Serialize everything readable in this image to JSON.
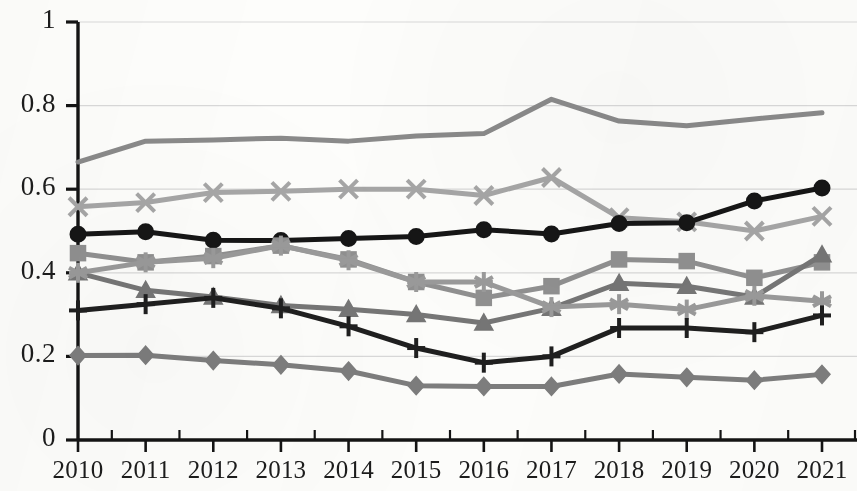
{
  "chart_data": {
    "type": "line",
    "title": "",
    "subtitle": "",
    "xlabel": "",
    "ylabel": "",
    "grid": "horizontal",
    "legend": "none",
    "xlim": [
      2010,
      2021
    ],
    "ylim": [
      0,
      1
    ],
    "ytick_labels": [
      "1",
      "0.8",
      "0.6",
      "0.4",
      "0.2",
      "0"
    ],
    "ytick_values": [
      1,
      0.8,
      0.6,
      0.4,
      0.2,
      0
    ],
    "categories": [
      "2010",
      "2011",
      "2012",
      "2013",
      "2014",
      "2015",
      "2016",
      "2017",
      "2018",
      "2019",
      "2020",
      "2021"
    ],
    "x": [
      2010,
      2011,
      2012,
      2013,
      2014,
      2015,
      2016,
      2017,
      2018,
      2019,
      2020,
      2021
    ],
    "series": [
      {
        "name": "series-1-plain-line",
        "marker": "none",
        "color": "#8a8a8a",
        "width": 5,
        "values": [
          0.665,
          0.715,
          0.718,
          0.722,
          0.715,
          0.727,
          0.733,
          0.815,
          0.763,
          0.752,
          0.768,
          0.783
        ]
      },
      {
        "name": "series-2-x",
        "marker": "x",
        "color": "#a6a6a6",
        "width": 5,
        "values": [
          0.558,
          0.568,
          0.592,
          0.595,
          0.6,
          0.6,
          0.585,
          0.628,
          0.532,
          0.522,
          0.5,
          0.535
        ]
      },
      {
        "name": "series-3-circle",
        "marker": "circle",
        "color": "#161616",
        "width": 5,
        "values": [
          0.492,
          0.498,
          0.478,
          0.477,
          0.482,
          0.487,
          0.503,
          0.493,
          0.518,
          0.52,
          0.572,
          0.603
        ]
      },
      {
        "name": "series-4-square",
        "marker": "square",
        "color": "#909090",
        "width": 5,
        "values": [
          0.447,
          0.425,
          0.44,
          0.465,
          0.432,
          0.378,
          0.34,
          0.368,
          0.432,
          0.428,
          0.388,
          0.425
        ]
      },
      {
        "name": "series-5-triangle",
        "marker": "triangle",
        "color": "#767676",
        "width": 5,
        "values": [
          0.4,
          0.358,
          0.342,
          0.322,
          0.313,
          0.3,
          0.28,
          0.315,
          0.375,
          0.368,
          0.342,
          0.443
        ]
      },
      {
        "name": "series-6-asterisk",
        "marker": "asterisk",
        "color": "#9a9a9a",
        "width": 5,
        "values": [
          0.4,
          0.425,
          0.435,
          0.465,
          0.43,
          0.378,
          0.378,
          0.318,
          0.325,
          0.312,
          0.345,
          0.332
        ]
      },
      {
        "name": "series-7-plus",
        "marker": "plus",
        "color": "#1f1f1f",
        "width": 5,
        "values": [
          0.31,
          0.325,
          0.34,
          0.315,
          0.272,
          0.22,
          0.185,
          0.2,
          0.268,
          0.268,
          0.258,
          0.298
        ]
      },
      {
        "name": "series-8-diamond",
        "marker": "diamond",
        "color": "#7d7d7d",
        "width": 5,
        "values": [
          0.202,
          0.203,
          0.19,
          0.18,
          0.165,
          0.13,
          0.128,
          0.128,
          0.158,
          0.15,
          0.143,
          0.157
        ]
      }
    ]
  },
  "axes": {
    "axis_color": "#141414",
    "grid_color": "#d9d9d9",
    "background": "#fdfdfb"
  },
  "geometry": {
    "plot_left": 78,
    "plot_right": 822,
    "plot_top": 22,
    "plot_bottom": 440
  }
}
